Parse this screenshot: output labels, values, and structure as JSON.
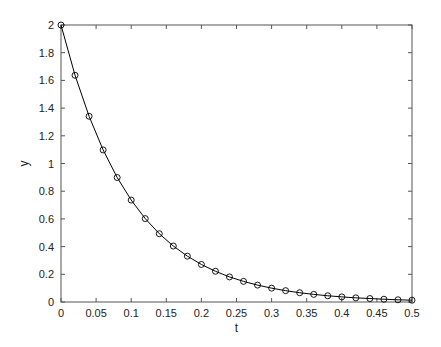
{
  "chart_data": {
    "type": "line",
    "title": "",
    "xlabel": "t",
    "ylabel": "y",
    "xlim": [
      0,
      0.5
    ],
    "ylim": [
      0,
      2
    ],
    "grid": false,
    "legend": null,
    "x_ticks": [
      "0",
      "0.05",
      "0.1",
      "0.15",
      "0.2",
      "0.25",
      "0.3",
      "0.35",
      "0.4",
      "0.45",
      "0.5"
    ],
    "y_ticks": [
      "0",
      "0.2",
      "0.4",
      "0.6",
      "0.8",
      "1",
      "1.2",
      "1.4",
      "1.6",
      "1.8",
      "2"
    ],
    "series": [
      {
        "name": "y",
        "marker": "circle",
        "color": "#000000",
        "x": [
          0,
          0.02,
          0.04,
          0.06,
          0.08,
          0.1,
          0.12,
          0.14,
          0.16,
          0.18,
          0.2,
          0.22,
          0.24,
          0.26,
          0.28,
          0.3,
          0.32,
          0.34,
          0.36,
          0.38,
          0.4,
          0.42,
          0.44,
          0.46,
          0.48,
          0.5
        ],
        "values": [
          2.0,
          1.637,
          1.341,
          1.098,
          0.899,
          0.736,
          0.602,
          0.493,
          0.404,
          0.331,
          0.271,
          0.222,
          0.181,
          0.149,
          0.122,
          0.1,
          0.082,
          0.067,
          0.055,
          0.045,
          0.037,
          0.03,
          0.025,
          0.02,
          0.016,
          0.013
        ]
      }
    ]
  }
}
